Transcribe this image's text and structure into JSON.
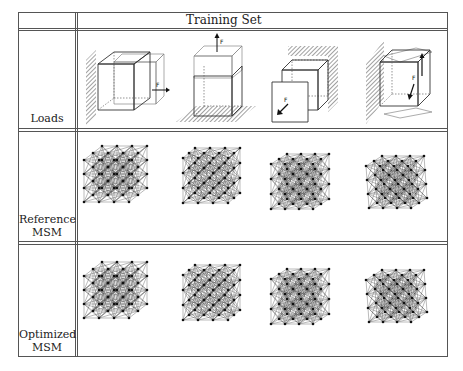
{
  "table": {
    "header": {
      "title": "Training Set"
    },
    "rows": [
      {
        "label": "Loads",
        "label_lines": [
          "Loads"
        ]
      },
      {
        "label": "Reference MSM",
        "label_lines": [
          "Reference",
          "MSM"
        ]
      },
      {
        "label": "Optimized MSM",
        "label_lines": [
          "Optimized",
          "MSM"
        ]
      }
    ],
    "load_cases": [
      {
        "id": 1,
        "force_label": "F",
        "support": "left wall",
        "force_direction": "right (+x)"
      },
      {
        "id": 2,
        "force_label": "F",
        "support": "floor",
        "force_direction": "up (+y)"
      },
      {
        "id": 3,
        "force_label": "F",
        "support": "back wall",
        "force_direction": "out of plane (+z)"
      },
      {
        "id": 4,
        "force_label": "F",
        "support": "left wall",
        "force_direction": "torsion (up/down pair)"
      }
    ],
    "mesh_columns": 4
  },
  "colors": {
    "border": "#555555",
    "mesh_node": "#111111",
    "mesh_edge": "#3a3a3a",
    "hatch": "#444444"
  }
}
